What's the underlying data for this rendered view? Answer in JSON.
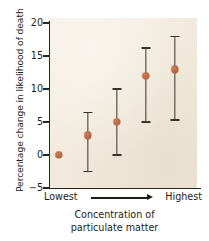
{
  "chart_data": {
    "type": "scatter",
    "title": "",
    "xlabel": "Concentration of particulate matter",
    "ylabel": "Percentage change in likelihood of death",
    "x_axis_left_label": "Lowest",
    "x_axis_right_label": "Highest",
    "x_axis_arrow": "right-arrow",
    "categories": [
      "1",
      "2",
      "3",
      "4",
      "5"
    ],
    "values": [
      0,
      3,
      5,
      12,
      13
    ],
    "error_low": [
      0,
      -2.5,
      0,
      5,
      5.3
    ],
    "error_high": [
      0,
      6.4,
      10,
      16.2,
      18
    ],
    "has_error_bars": [
      false,
      true,
      true,
      true,
      true
    ],
    "ylim": [
      -5,
      20
    ],
    "yticks": [
      20,
      15,
      10,
      5,
      0,
      -5
    ],
    "ytick_labels": [
      "20",
      "15",
      "10",
      "5",
      "0",
      "−5"
    ],
    "grid": false,
    "legend": "none",
    "marker_color": "#b9603a",
    "errorbar_color": "#3b332b",
    "plot_background": "#f2ebdd",
    "axis_color": "#2b2620"
  },
  "axis": {
    "y_title": "Percentage change in likelihood of death",
    "ticks": [
      {
        "label": "20",
        "value": 20
      },
      {
        "label": "15",
        "value": 15
      },
      {
        "label": "10",
        "value": 10
      },
      {
        "label": "5",
        "value": 5
      },
      {
        "label": "0",
        "value": 0
      },
      {
        "label": "−5",
        "value": -5
      }
    ]
  },
  "xaxis": {
    "left_label": "Lowest",
    "right_label": "Highest"
  },
  "caption": {
    "line1": "Concentration of",
    "line2": "particulate matter"
  }
}
